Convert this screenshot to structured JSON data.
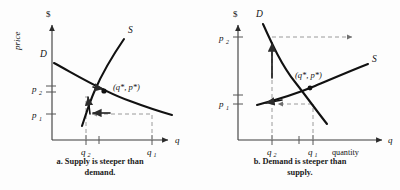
{
  "figure": {
    "background_color": "#fdfdfd",
    "curve_color": "#111111",
    "guide_color": "#9a9a9a",
    "axis_color": "#3a3a3a"
  },
  "panels": [
    {
      "id": "a",
      "caption_line1": "a.  Supply is steeper than",
      "caption_line2": "demand.",
      "y_axis": {
        "unit_label": "$",
        "axis_title": "price",
        "ticks": [
          "p₂",
          "p₁"
        ],
        "tick_main": [
          "p",
          "p"
        ],
        "tick_sub": [
          "2",
          "1"
        ]
      },
      "x_axis": {
        "axis_title": "q",
        "ticks": [
          "q₂",
          "q₁"
        ],
        "tick_main": [
          "q",
          "q"
        ],
        "tick_sub": [
          "2",
          "1"
        ]
      },
      "curves": [
        {
          "name": "demand",
          "label": "D",
          "shape": "downward-sloping-flat"
        },
        {
          "name": "supply",
          "label": "S",
          "shape": "upward-sloping-steep"
        }
      ],
      "equilibrium_label": "(q*, p*)",
      "arrows": [
        {
          "name": "price-adjust-up-arrow",
          "direction": "up-left-along-demand"
        },
        {
          "name": "quantity-adjust-left-arrow",
          "direction": "left"
        },
        {
          "name": "equilibrium-approach-arrow",
          "direction": "right"
        }
      ]
    },
    {
      "id": "b",
      "caption_line1": "b.  Demand is steeper than",
      "caption_line2": "supply.",
      "y_axis": {
        "unit_label": "$",
        "axis_title": "",
        "ticks": [
          "p₂",
          "p₁"
        ],
        "tick_main": [
          "p",
          "p"
        ],
        "tick_sub": [
          "2",
          "1"
        ]
      },
      "x_axis": {
        "axis_title": "q",
        "axis_word": "quantity",
        "ticks": [
          "q₂",
          "q₁"
        ],
        "tick_main": [
          "q",
          "q"
        ],
        "tick_sub": [
          "2",
          "1"
        ]
      },
      "curves": [
        {
          "name": "demand",
          "label": "D",
          "shape": "downward-sloping-steep"
        },
        {
          "name": "supply",
          "label": "S",
          "shape": "upward-sloping-flat"
        }
      ],
      "equilibrium_label": "(q*, p*)",
      "arrows": [
        {
          "name": "price-adjust-up-arrow",
          "direction": "up-along-demand"
        },
        {
          "name": "price-diverge-right-arrow",
          "direction": "right"
        },
        {
          "name": "quantity-adjust-left-arrow",
          "direction": "left"
        }
      ]
    }
  ]
}
